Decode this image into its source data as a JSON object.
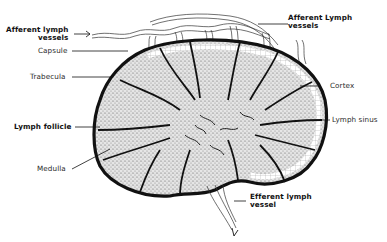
{
  "diagram": {
    "labels": {
      "afferent_left_line1": "Afferent lymph",
      "afferent_left_line2": "vessels",
      "capsule": "Capsule",
      "trabecula": "Trabecula",
      "lymph_follicle": "Lymph follicle",
      "medulla": "Medulla",
      "afferent_right_line1": "Afferent Lymph",
      "afferent_right_line2": "vessels",
      "cortex": "Cortex",
      "lymph_sinus": "Lymph sinus",
      "efferent_line1": "Efferent lymph",
      "efferent_line2": "vessel"
    },
    "colors": {
      "ink": "#111111",
      "paper": "#ffffff",
      "tissue": "#cfcfcf"
    }
  }
}
